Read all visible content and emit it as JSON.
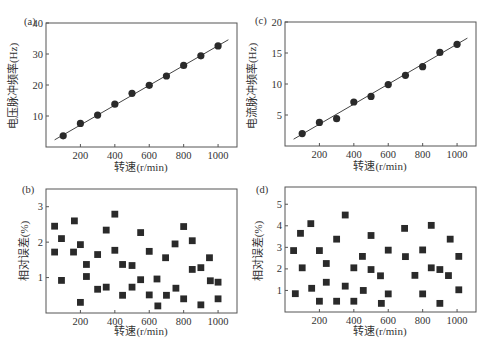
{
  "chart_data": [
    {
      "panel": "(a)",
      "type": "scatter",
      "marker": "circle",
      "fit_line": {
        "x": [
          50,
          1060
        ],
        "y": [
          2.3,
          34.6
        ]
      },
      "xlabel": "转速(r/min)",
      "ylabel": "电压脉冲频率(Hz)",
      "xlim": [
        0,
        1110
      ],
      "ylim": [
        0,
        40
      ],
      "xticks": [
        200,
        400,
        600,
        800,
        1000
      ],
      "yticks": [
        10,
        20,
        30,
        40
      ],
      "grid": false,
      "x": [
        100,
        200,
        300,
        400,
        500,
        600,
        700,
        800,
        900,
        1000
      ],
      "y": [
        3.6,
        7.6,
        10.3,
        13.8,
        17.3,
        19.9,
        22.9,
        26.3,
        29.4,
        32.6
      ]
    },
    {
      "panel": "(c)",
      "type": "scatter",
      "marker": "circle",
      "fit_line": {
        "x": [
          50,
          1060
        ],
        "y": [
          1.1,
          17.4
        ]
      },
      "xlabel": "转速(r/min)",
      "ylabel": "电流脉冲频率(Hz)",
      "xlim": [
        0,
        1110
      ],
      "ylim": [
        0,
        20
      ],
      "xticks": [
        200,
        400,
        600,
        800,
        1000
      ],
      "yticks": [
        5,
        10,
        15,
        20
      ],
      "grid": false,
      "x": [
        100,
        200,
        300,
        400,
        500,
        600,
        700,
        800,
        900,
        1000
      ],
      "y": [
        2.0,
        3.8,
        4.4,
        7.1,
        8.0,
        9.9,
        11.4,
        12.8,
        15.1,
        16.4
      ]
    },
    {
      "panel": "(b)",
      "type": "scatter",
      "marker": "square",
      "xlabel": "转速(r/min)",
      "ylabel": "相对误差(%)",
      "xlim": [
        0,
        1110
      ],
      "ylim": [
        0,
        3.5
      ],
      "xticks": [
        200,
        400,
        600,
        800,
        1000
      ],
      "yticks": [
        1,
        2,
        3
      ],
      "grid": false,
      "x": [
        50,
        50,
        90,
        90,
        160,
        165,
        200,
        200,
        235,
        235,
        300,
        300,
        350,
        350,
        400,
        400,
        445,
        445,
        500,
        500,
        550,
        550,
        600,
        600,
        645,
        650,
        695,
        700,
        750,
        755,
        800,
        800,
        850,
        850,
        900,
        900,
        950,
        955,
        1000,
        1000
      ],
      "y": [
        2.45,
        1.72,
        2.1,
        0.92,
        1.72,
        2.6,
        1.93,
        0.3,
        1.37,
        1.03,
        1.65,
        0.67,
        2.34,
        0.73,
        2.79,
        1.77,
        1.37,
        0.5,
        1.34,
        0.73,
        2.27,
        0.94,
        1.74,
        0.51,
        0.96,
        0.2,
        1.56,
        0.5,
        1.95,
        0.7,
        2.44,
        0.4,
        2.04,
        1.23,
        1.28,
        0.23,
        1.56,
        0.91,
        0.87,
        0.4
      ]
    },
    {
      "panel": "(d)",
      "type": "scatter",
      "marker": "square",
      "xlabel": "转速(r/min)",
      "ylabel": "相对误差(%)",
      "xlim": [
        0,
        1110
      ],
      "ylim": [
        0,
        5.8
      ],
      "xticks": [
        200,
        400,
        600,
        800,
        1000
      ],
      "yticks": [
        1,
        2,
        3,
        4,
        5
      ],
      "grid": false,
      "x": [
        50,
        60,
        90,
        100,
        150,
        155,
        200,
        200,
        240,
        240,
        300,
        300,
        350,
        350,
        400,
        400,
        450,
        455,
        500,
        500,
        555,
        560,
        600,
        600,
        695,
        700,
        755,
        800,
        800,
        850,
        850,
        900,
        900,
        950,
        960,
        1010,
        1010
      ],
      "y": [
        2.85,
        0.85,
        3.65,
        2.05,
        4.1,
        1.1,
        2.85,
        0.5,
        2.25,
        1.38,
        3.38,
        0.5,
        4.5,
        1.2,
        2.05,
        0.5,
        2.58,
        1.0,
        3.55,
        1.97,
        1.68,
        0.4,
        2.87,
        0.84,
        3.88,
        2.57,
        1.7,
        2.88,
        0.84,
        4.02,
        2.05,
        1.97,
        0.4,
        1.69,
        3.38,
        2.58,
        1.03
      ]
    }
  ],
  "panels": {
    "a": {
      "label": "(a)",
      "xlabel": "转速(r/min)",
      "ylabel": "电压脉冲频率(Hz)"
    },
    "b": {
      "label": "(b)",
      "xlabel": "转速(r/min)",
      "ylabel": "相对误差(%)"
    },
    "c": {
      "label": "(c)",
      "xlabel": "转速(r/min)",
      "ylabel": "电流脉冲频率(Hz)"
    },
    "d": {
      "label": "(d)",
      "xlabel": "转速(r/min)",
      "ylabel": "相对误差(%)"
    }
  },
  "colors": {
    "axis": "#555555",
    "marker": "#2a2a2a",
    "fit_line": "#444444",
    "text": "#333333"
  }
}
